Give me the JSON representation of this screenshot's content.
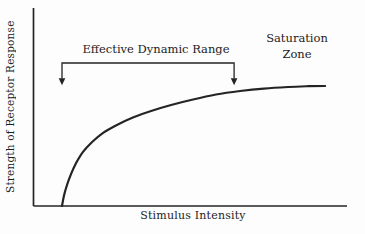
{
  "figure": {
    "colors": {
      "line": "#242424",
      "text": "#1c1c1c",
      "background": "#fdfdfd"
    }
  },
  "chart_data": {
    "type": "line",
    "title": "",
    "xlabel": "Stimulus Intensity",
    "ylabel": "Strength of Receptor Response",
    "grid": false,
    "axis_style": "L-shaped axes, no ticks, no tick labels, relative (unlabeled) units",
    "x_range": [
      0,
      1
    ],
    "y_range": [
      0,
      1
    ],
    "series": [
      {
        "name": "receptor response curve",
        "shape": "steep rise then saturating plateau",
        "points_frac": [
          [
            0.091,
            0.0
          ],
          [
            0.097,
            0.051
          ],
          [
            0.107,
            0.106
          ],
          [
            0.12,
            0.162
          ],
          [
            0.136,
            0.217
          ],
          [
            0.158,
            0.273
          ],
          [
            0.187,
            0.323
          ],
          [
            0.222,
            0.369
          ],
          [
            0.266,
            0.409
          ],
          [
            0.317,
            0.447
          ],
          [
            0.375,
            0.48
          ],
          [
            0.439,
            0.51
          ],
          [
            0.509,
            0.538
          ],
          [
            0.582,
            0.563
          ],
          [
            0.659,
            0.581
          ],
          [
            0.735,
            0.593
          ],
          [
            0.812,
            0.601
          ],
          [
            0.876,
            0.605
          ],
          [
            0.93,
            0.606
          ]
        ]
      }
    ],
    "annotations": [
      {
        "type": "bracket",
        "label": "Effective Dynamic Range",
        "arrow_ends": "down",
        "x_span_frac": [
          0.091,
          0.64
        ],
        "bar_y_frac": 0.722,
        "tip_y_frac": 0.61
      },
      {
        "type": "text",
        "label": "Saturation Zone",
        "position": "upper-right"
      }
    ]
  }
}
